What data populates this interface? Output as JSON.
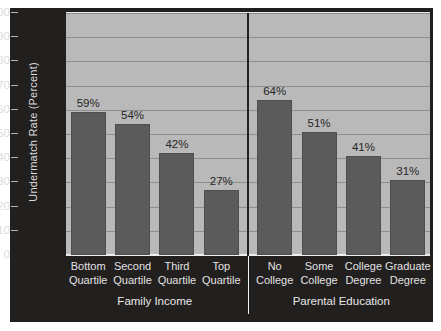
{
  "chart_data": {
    "type": "bar",
    "title": "",
    "subtitle": "",
    "xlabel": "",
    "ylabel": "Undermatch Rate (Percent)",
    "ylim": [
      0,
      100
    ],
    "ytick_labels": [
      "100",
      "90",
      "80",
      "70",
      "60",
      "50",
      "40",
      "30",
      "20",
      "10",
      "0"
    ],
    "ytick_values": [
      100,
      90,
      80,
      70,
      60,
      50,
      40,
      30,
      20,
      10,
      0
    ],
    "grid": true,
    "legend": "none",
    "value_suffix": "%",
    "groups": [
      {
        "name": "Family Income",
        "categories": [
          "Bottom Quartile",
          "Second Quartile",
          "Third Quartile",
          "Top Quartile"
        ],
        "values": [
          59,
          54,
          42,
          27
        ],
        "data_labels": [
          "59%",
          "54%",
          "42%",
          "27%"
        ]
      },
      {
        "name": "Parental Education",
        "categories": [
          "No College",
          "Some College",
          "College Degree",
          "Graduate Degree"
        ],
        "values": [
          64,
          51,
          41,
          31
        ],
        "data_labels": [
          "64%",
          "51%",
          "41%",
          "31%"
        ]
      }
    ],
    "categories": [
      "Bottom Quartile",
      "Second Quartile",
      "Third Quartile",
      "Top Quartile",
      "No College",
      "Some College",
      "College Degree",
      "Graduate Degree"
    ],
    "values": [
      59,
      54,
      42,
      27,
      64,
      51,
      41,
      31
    ],
    "colors": {
      "bar_fill": "#5b5b5b",
      "plot_background": "#b9b9b9",
      "gridline": "#8e8e8e",
      "panel_background": "#221f1f",
      "axis_text": "#dcdcdc",
      "data_label_text": "#262626"
    }
  }
}
